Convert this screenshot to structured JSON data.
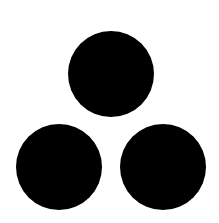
{
  "canvas": {
    "width": 219,
    "height": 223,
    "background": "#ffffff"
  },
  "shapes": {
    "fill": "#000000",
    "circles": [
      {
        "name": "top-circle",
        "cx": 111,
        "cy": 74,
        "r": 43
      },
      {
        "name": "bottom-left-circle",
        "cx": 59,
        "cy": 167,
        "r": 43
      },
      {
        "name": "bottom-right-circle",
        "cx": 163,
        "cy": 167,
        "r": 43
      }
    ]
  }
}
